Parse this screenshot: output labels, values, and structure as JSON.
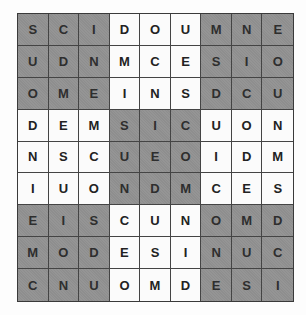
{
  "puzzle": {
    "type": "sudoku-letters",
    "letters": [
      "C",
      "D",
      "E",
      "I",
      "M",
      "N",
      "O",
      "S",
      "U"
    ],
    "colors": {
      "shaded_cell": "#8e8e8e",
      "plain_cell": "#fbfbfb",
      "text": "#222222",
      "grid_line": "#444444"
    },
    "shaded_boxes": [
      [
        0,
        0
      ],
      [
        0,
        2
      ],
      [
        1,
        1
      ],
      [
        2,
        0
      ],
      [
        2,
        2
      ]
    ],
    "rows": [
      [
        "S",
        "C",
        "I",
        "D",
        "O",
        "U",
        "M",
        "N",
        "E"
      ],
      [
        "U",
        "D",
        "N",
        "M",
        "C",
        "E",
        "S",
        "I",
        "O"
      ],
      [
        "O",
        "M",
        "E",
        "I",
        "N",
        "S",
        "D",
        "C",
        "U"
      ],
      [
        "D",
        "E",
        "M",
        "S",
        "I",
        "C",
        "U",
        "O",
        "N"
      ],
      [
        "N",
        "S",
        "C",
        "U",
        "E",
        "O",
        "I",
        "D",
        "M"
      ],
      [
        "I",
        "U",
        "O",
        "N",
        "D",
        "M",
        "C",
        "E",
        "S"
      ],
      [
        "E",
        "I",
        "S",
        "C",
        "U",
        "N",
        "O",
        "M",
        "D"
      ],
      [
        "M",
        "O",
        "D",
        "E",
        "S",
        "I",
        "N",
        "U",
        "C"
      ],
      [
        "C",
        "N",
        "U",
        "O",
        "M",
        "D",
        "E",
        "S",
        "I"
      ]
    ]
  }
}
